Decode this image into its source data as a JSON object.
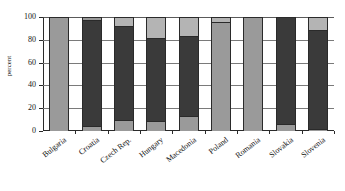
{
  "chart_data": {
    "type": "bar",
    "subtype": "stacked-bar",
    "title": "",
    "xlabel": "",
    "ylabel": "percent",
    "ylim": [
      0,
      100
    ],
    "yticks": [
      0,
      20,
      40,
      60,
      80,
      100
    ],
    "ytick_labels": [
      "0",
      "20",
      "40",
      "60",
      "80",
      "100"
    ],
    "grid": true,
    "grid_axis": "y",
    "legend": "none",
    "categories": [
      "Bulgaria",
      "Croatia",
      "Czech Rep.",
      "Hungary",
      "Macedonia",
      "Poland",
      "Romania",
      "Slovakia",
      "Slovenia"
    ],
    "series": [
      {
        "name": "bottom",
        "color": "#9a9a9a",
        "values": [
          0,
          4,
          10,
          9,
          13,
          0,
          0,
          6,
          2
        ]
      },
      {
        "name": "middle",
        "color": "#3a3a3a",
        "values": [
          0,
          93,
          82,
          73,
          70,
          0,
          0,
          94,
          87
        ]
      },
      {
        "name": "top",
        "color": "#9a9a9a",
        "values": [
          100,
          3,
          8,
          18,
          17,
          100,
          100,
          0,
          11
        ]
      }
    ],
    "bars": [
      {
        "category": "Bulgaria",
        "segments": [
          {
            "from": 0,
            "to": 100,
            "color": "#9a9a9a",
            "shade": "medium"
          }
        ]
      },
      {
        "category": "Croatia",
        "segments": [
          {
            "from": 0,
            "to": 4,
            "color": "#9a9a9a",
            "shade": "medium"
          },
          {
            "from": 4,
            "to": 97,
            "color": "#3a3a3a",
            "shade": "dark"
          },
          {
            "from": 97,
            "to": 100,
            "color": "#9a9a9a",
            "shade": "medium"
          }
        ]
      },
      {
        "category": "Czech Rep.",
        "segments": [
          {
            "from": 0,
            "to": 10,
            "color": "#9a9a9a",
            "shade": "medium"
          },
          {
            "from": 10,
            "to": 92,
            "color": "#3a3a3a",
            "shade": "dark"
          },
          {
            "from": 92,
            "to": 100,
            "color": "#b4b4b4",
            "shade": "light"
          }
        ]
      },
      {
        "category": "Hungary",
        "segments": [
          {
            "from": 0,
            "to": 9,
            "color": "#9a9a9a",
            "shade": "medium"
          },
          {
            "from": 9,
            "to": 82,
            "color": "#3a3a3a",
            "shade": "dark"
          },
          {
            "from": 82,
            "to": 100,
            "color": "#b4b4b4",
            "shade": "light"
          }
        ]
      },
      {
        "category": "Macedonia",
        "segments": [
          {
            "from": 0,
            "to": 13,
            "color": "#9a9a9a",
            "shade": "medium"
          },
          {
            "from": 13,
            "to": 83,
            "color": "#3a3a3a",
            "shade": "dark"
          },
          {
            "from": 83,
            "to": 100,
            "color": "#b4b4b4",
            "shade": "light"
          }
        ]
      },
      {
        "category": "Poland",
        "segments": [
          {
            "from": 0,
            "to": 96,
            "color": "#9a9a9a",
            "shade": "medium"
          },
          {
            "from": 96,
            "to": 100,
            "color": "#b4b4b4",
            "shade": "light"
          }
        ]
      },
      {
        "category": "Romania",
        "segments": [
          {
            "from": 0,
            "to": 100,
            "color": "#9a9a9a",
            "shade": "medium"
          }
        ]
      },
      {
        "category": "Slovakia",
        "segments": [
          {
            "from": 0,
            "to": 6,
            "color": "#9a9a9a",
            "shade": "medium"
          },
          {
            "from": 6,
            "to": 100,
            "color": "#3a3a3a",
            "shade": "dark"
          }
        ]
      },
      {
        "category": "Slovenia",
        "segments": [
          {
            "from": 0,
            "to": 2,
            "color": "#9a9a9a",
            "shade": "medium"
          },
          {
            "from": 2,
            "to": 89,
            "color": "#3a3a3a",
            "shade": "dark"
          },
          {
            "from": 89,
            "to": 100,
            "color": "#b4b4b4",
            "shade": "light"
          }
        ]
      }
    ]
  }
}
